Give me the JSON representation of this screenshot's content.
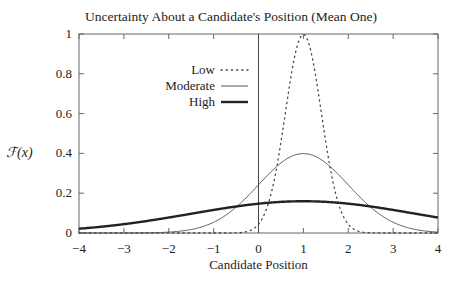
{
  "chart_data": {
    "type": "line",
    "title": "Uncertainty About a Candidate's Position (Mean One)",
    "xlabel": "Candidate Position",
    "ylabel": "ℱ(x)",
    "xlim": [
      -4,
      4
    ],
    "ylim": [
      0,
      1
    ],
    "xticks": [
      "−4",
      "−3",
      "−2",
      "−1",
      "0",
      "1",
      "2",
      "3",
      "4"
    ],
    "xtick_values": [
      -4,
      -3,
      -2,
      -1,
      0,
      1,
      2,
      3,
      4
    ],
    "yticks": [
      "0",
      "0.2",
      "0.4",
      "0.6",
      "0.8",
      "1"
    ],
    "ytick_values": [
      0,
      0.2,
      0.4,
      0.6,
      0.8,
      1
    ],
    "grid": false,
    "vertical_reference_line": 0,
    "legend_position": "upper-left",
    "series": [
      {
        "name": "Low",
        "style": "dotted",
        "distribution": "normal",
        "mean": 1,
        "sd": 0.4,
        "peak": 1.0,
        "color": "#444444",
        "width": 1
      },
      {
        "name": "Moderate",
        "style": "solid",
        "distribution": "normal",
        "mean": 1,
        "sd": 1.0,
        "peak": 0.4,
        "color": "#555555",
        "width": 1
      },
      {
        "name": "High",
        "style": "solid-thick",
        "distribution": "normal",
        "mean": 1,
        "sd": 2.5,
        "peak": 0.16,
        "color": "#222222",
        "width": 2.4
      }
    ]
  },
  "legend": {
    "items": [
      {
        "label": "Low"
      },
      {
        "label": "Moderate"
      },
      {
        "label": "High"
      }
    ]
  }
}
